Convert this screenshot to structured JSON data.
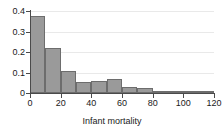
{
  "chart_data": {
    "type": "bar",
    "title": "",
    "subtitle": "",
    "xlabel": "Infant mortality",
    "ylabel": "",
    "categories": [
      "0-10",
      "10-20",
      "20-30",
      "30-40",
      "40-50",
      "50-60",
      "60-70",
      "70-80",
      "80-90",
      "90-100",
      "100-110",
      "110-120"
    ],
    "bin_edges": [
      0,
      10,
      20,
      30,
      40,
      50,
      60,
      70,
      80,
      90,
      100,
      110,
      120
    ],
    "bin_width": 10,
    "values": [
      0.375,
      0.222,
      0.107,
      0.055,
      0.06,
      0.07,
      0.029,
      0.024,
      0.004,
      0.009,
      0.009,
      0.002
    ],
    "xlim": [
      0,
      120
    ],
    "ylim": [
      0,
      0.4
    ],
    "x_ticks": [
      "0",
      "20",
      "40",
      "60",
      "80",
      "100",
      "120"
    ],
    "x_tick_values": [
      0,
      20,
      40,
      60,
      80,
      100,
      120
    ],
    "y_ticks": [
      "0",
      "0.1",
      "0.2",
      "0.3",
      "0.4"
    ],
    "y_tick_values": [
      0,
      0.1,
      0.2,
      0.3,
      0.4
    ],
    "grid": true,
    "grid_axis": "y",
    "legend": false,
    "legend_position": "none",
    "bar_fill_color": "#9a9a9a",
    "bar_edge_color": "#6d6d6d",
    "axis_color": "#4a4a4a",
    "grid_color": "#e9e9e9",
    "background_color": "#ffffff",
    "annotations": []
  }
}
